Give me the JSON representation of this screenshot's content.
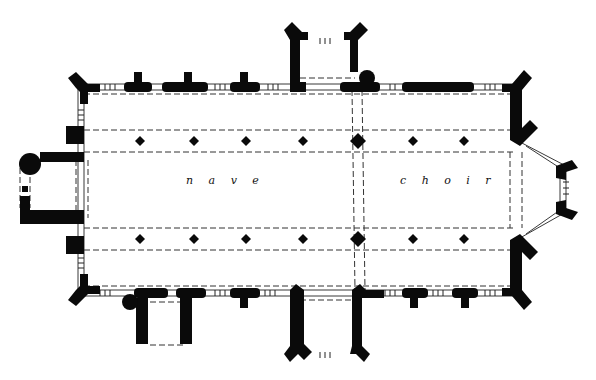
{
  "diagram": {
    "type": "architectural-floor-plan",
    "background_color": "#ffffff",
    "ink_color": "#0a0a0a",
    "labels": [
      {
        "id": "nave",
        "text": "n a v e",
        "x": 186,
        "y": 181
      },
      {
        "id": "choir",
        "text": "c h o i r",
        "x": 400,
        "y": 181
      }
    ],
    "regions": [
      "west tower",
      "nave",
      "choir",
      "apse",
      "north porch",
      "south porch",
      "north chapel",
      "south chapel"
    ],
    "pier_rows": {
      "north_y": 141,
      "south_y": 239,
      "x_positions": [
        140,
        194,
        246,
        303,
        358,
        413,
        464
      ]
    }
  }
}
